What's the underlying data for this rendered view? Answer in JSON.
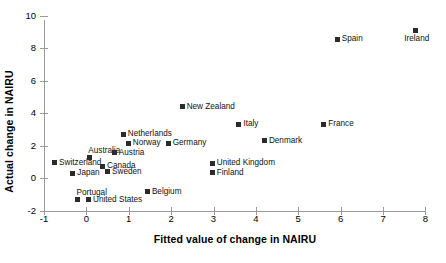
{
  "chart_data": {
    "type": "scatter",
    "title": "",
    "xlabel": "Fitted value of change in NAIRU",
    "ylabel": "Actual change in NAIRU",
    "xlim": [
      -1,
      8
    ],
    "ylim": [
      -2,
      10
    ],
    "xticks": [
      -1,
      0,
      1,
      2,
      3,
      4,
      5,
      6,
      7,
      8
    ],
    "yticks": [
      -2,
      0,
      2,
      4,
      6,
      8,
      10
    ],
    "grid": false,
    "legend": "none",
    "marker": "filled-square",
    "marker_color": "#2b2b2b",
    "points": [
      {
        "label": "Switzerland",
        "x": -0.75,
        "y": 0.95,
        "label_pos": "right"
      },
      {
        "label": "Portugal",
        "x": -0.21,
        "y": -1.35,
        "label_pos": "above"
      },
      {
        "label": "Japan",
        "x": -0.32,
        "y": 0.3,
        "label_pos": "right"
      },
      {
        "label": "United States",
        "x": 0.05,
        "y": -1.35,
        "label_pos": "right"
      },
      {
        "label": "Australia",
        "x": 0.07,
        "y": 1.25,
        "label_pos": "above"
      },
      {
        "label": "Canada",
        "x": 0.38,
        "y": 0.72,
        "label_pos": "right"
      },
      {
        "label": "Sweden",
        "x": 0.5,
        "y": 0.38,
        "label_pos": "right"
      },
      {
        "label": "Austria",
        "x": 0.66,
        "y": 1.54,
        "label_pos": "right"
      },
      {
        "label": "Netherlands",
        "x": 0.87,
        "y": 2.7,
        "label_pos": "right"
      },
      {
        "label": "Norway",
        "x": 0.99,
        "y": 2.15,
        "label_pos": "right"
      },
      {
        "label": "Germany",
        "x": 1.93,
        "y": 2.15,
        "label_pos": "right"
      },
      {
        "label": "Belgium",
        "x": 1.44,
        "y": -0.86,
        "label_pos": "right"
      },
      {
        "label": "New Zealand",
        "x": 2.26,
        "y": 4.4,
        "label_pos": "right"
      },
      {
        "label": "United Kingdom",
        "x": 2.97,
        "y": 0.92,
        "label_pos": "right"
      },
      {
        "label": "Finland",
        "x": 2.97,
        "y": 0.31,
        "label_pos": "right"
      },
      {
        "label": "Italy",
        "x": 3.6,
        "y": 3.3,
        "label_pos": "right"
      },
      {
        "label": "Denmark",
        "x": 4.2,
        "y": 2.3,
        "label_pos": "right"
      },
      {
        "label": "France",
        "x": 5.6,
        "y": 3.3,
        "label_pos": "right"
      },
      {
        "label": "Spain",
        "x": 5.92,
        "y": 8.55,
        "label_pos": "right"
      },
      {
        "label": "Ireland",
        "x": 7.76,
        "y": 9.1,
        "label_pos": "below"
      }
    ]
  }
}
